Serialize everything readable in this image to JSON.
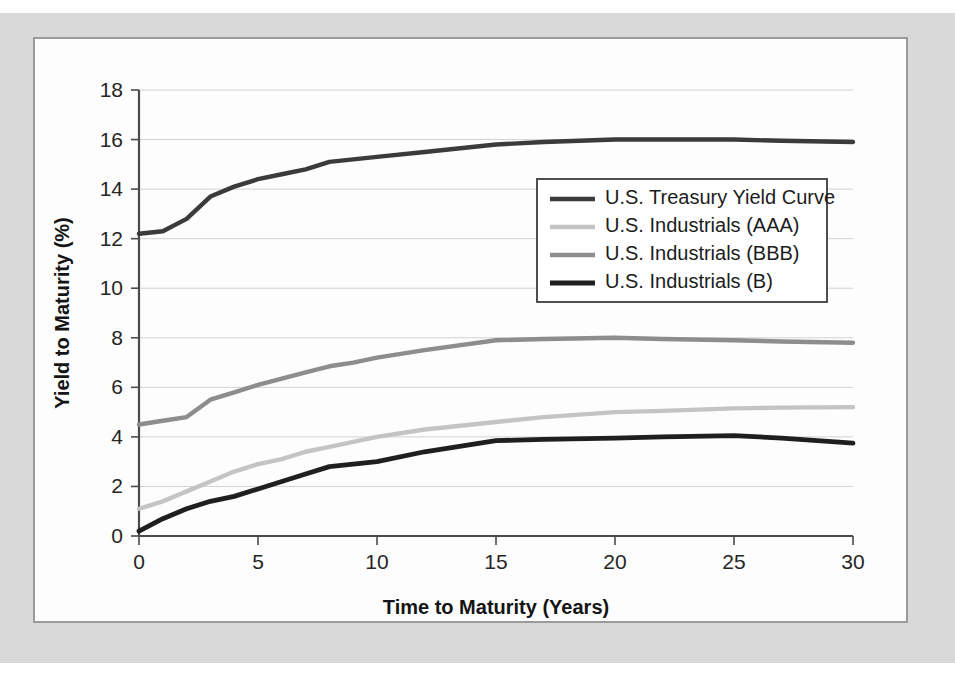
{
  "chart_data": {
    "type": "line",
    "title": "",
    "xlabel": "Time to Maturity (Years)",
    "ylabel": "Yield to Maturity (%)",
    "xlim": [
      0,
      30
    ],
    "ylim": [
      0,
      18
    ],
    "xticks": [
      0,
      5,
      10,
      15,
      20,
      25,
      30
    ],
    "yticks": [
      0,
      2,
      4,
      6,
      8,
      10,
      12,
      14,
      16,
      18
    ],
    "grid": true,
    "legend_position": "upper right",
    "x": [
      0,
      1,
      2,
      3,
      4,
      5,
      6,
      7,
      8,
      9,
      10,
      12,
      15,
      17,
      20,
      22,
      25,
      27,
      30
    ],
    "series": [
      {
        "name": "U.S. Treasury Yield Curve",
        "color": "#3b3b3b",
        "width": 4.4,
        "values": [
          12.2,
          12.3,
          12.8,
          13.7,
          14.1,
          14.4,
          14.6,
          14.8,
          15.1,
          15.2,
          15.3,
          15.5,
          15.8,
          15.9,
          16.0,
          16.0,
          16.0,
          15.95,
          15.9
        ]
      },
      {
        "name": "U.S. Industrials (AAA)",
        "color": "#c4c4c4",
        "width": 4.4,
        "values": [
          1.1,
          1.4,
          1.8,
          2.2,
          2.6,
          2.9,
          3.1,
          3.4,
          3.6,
          3.8,
          4.0,
          4.3,
          4.6,
          4.8,
          5.0,
          5.05,
          5.15,
          5.18,
          5.2
        ]
      },
      {
        "name": "U.S. Industrials (BBB)",
        "color": "#8d8d8d",
        "width": 4.4,
        "values": [
          4.5,
          4.65,
          4.8,
          5.5,
          5.8,
          6.1,
          6.35,
          6.6,
          6.85,
          7.0,
          7.2,
          7.5,
          7.9,
          7.95,
          8.0,
          7.95,
          7.9,
          7.85,
          7.8
        ]
      },
      {
        "name": "U.S. Industrials (B)",
        "color": "#1f1f1f",
        "width": 4.8,
        "values": [
          0.2,
          0.7,
          1.1,
          1.4,
          1.6,
          1.9,
          2.2,
          2.5,
          2.8,
          2.9,
          3.0,
          3.4,
          3.85,
          3.9,
          3.95,
          4.0,
          4.05,
          3.95,
          3.75
        ]
      }
    ]
  },
  "legend": {
    "entries": [
      "U.S. Treasury Yield Curve",
      "U.S. Industrials (AAA)",
      "U.S. Industrials (BBB)",
      "U.S. Industrials (B)"
    ]
  },
  "colors": {
    "mat": "#d9d9d9",
    "panel": "#fdfdfd",
    "panel_border": "#9a9a9a",
    "axis": "#4a4a4a",
    "grid": "#d2d2d2",
    "text": "#1c1c1c"
  }
}
